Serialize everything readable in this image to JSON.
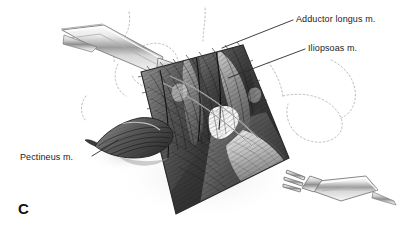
{
  "figure": {
    "panel_letter": "C",
    "kind": "surgical-anatomy-illustration",
    "region": "anterior hip / femoral triangle dissection",
    "background_color": "#ffffff",
    "ink_color": "#1b1b1b",
    "dotted_contour_color": "#b9b9b9",
    "leader_line_color": "#2a2a2a"
  },
  "labels": [
    {
      "id": "adductor-longus",
      "text": "Adductor longus m.",
      "text_x": 296,
      "text_y": 20,
      "leader_from_x": 293,
      "leader_from_y": 20,
      "leader_to_x": 222,
      "leader_to_y": 48
    },
    {
      "id": "iliopsoas",
      "text": "Iliopsoas m.",
      "text_x": 308,
      "text_y": 49,
      "leader_from_x": 305,
      "leader_from_y": 49,
      "leader_to_x": 228,
      "leader_to_y": 78
    },
    {
      "id": "pectineus",
      "text": "Pectineus m.",
      "text_x": 20,
      "text_y": 158,
      "leader_from_x": 92,
      "leader_from_y": 156,
      "leader_to_x": 118,
      "leader_to_y": 140
    }
  ],
  "instruments": [
    {
      "id": "retractor-upper-left",
      "name": "three-pronged rake retractor",
      "prongs": 3,
      "entry": "upper-left",
      "angle_deg": 28
    },
    {
      "id": "retractor-lower-right",
      "name": "three-pronged rake retractor",
      "prongs": 3,
      "entry": "lower-right",
      "angle_deg": 28
    }
  ],
  "structures": [
    {
      "id": "adductor-longus",
      "name": "Adductor longus m.",
      "labeled": true
    },
    {
      "id": "iliopsoas",
      "name": "Iliopsoas m.",
      "labeled": true
    },
    {
      "id": "pectineus",
      "name": "Pectineus m.",
      "labeled": true,
      "state": "reflected muscle flap"
    },
    {
      "id": "wound-field",
      "name": "open dissection field",
      "labeled": false
    },
    {
      "id": "interval-window",
      "name": "bright interval window",
      "labeled": false
    }
  ]
}
